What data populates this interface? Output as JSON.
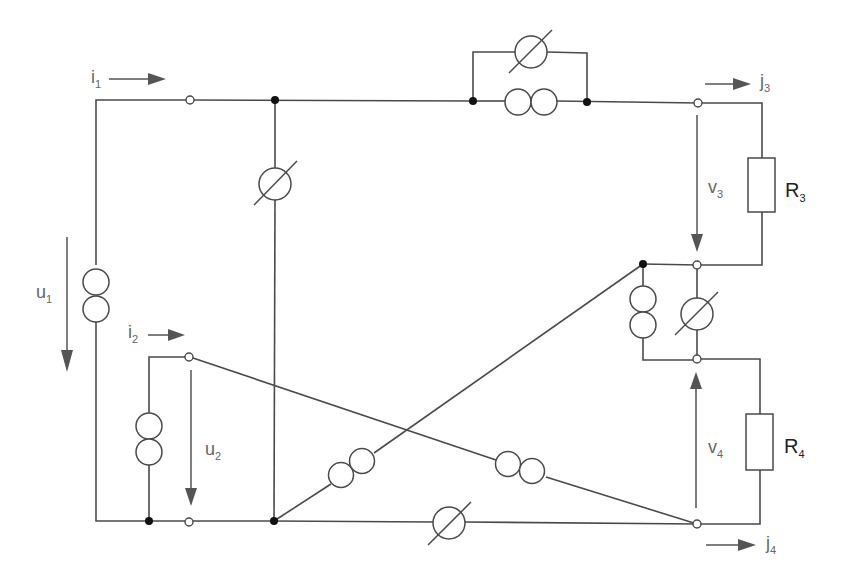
{
  "diagram": {
    "type": "electrical circuit schematic",
    "labels": {
      "i1": {
        "main": "i",
        "sub": "1"
      },
      "i2": {
        "main": "i",
        "sub": "2"
      },
      "j3": {
        "main": "j",
        "sub": "3"
      },
      "j4": {
        "main": "j",
        "sub": "4"
      },
      "u1": {
        "main": "u",
        "sub": "1"
      },
      "u2": {
        "main": "u",
        "sub": "2"
      },
      "v3": {
        "main": "v",
        "sub": "3"
      },
      "v4": {
        "main": "v",
        "sub": "4"
      },
      "R3": {
        "main": "R",
        "sub": "3"
      },
      "R4": {
        "main": "R",
        "sub": "4"
      }
    },
    "components": [
      {
        "id": "transformer-u1",
        "kind": "double-circle (transformer/coupled source)",
        "location": "left vertical branch"
      },
      {
        "id": "transformer-u2",
        "kind": "double-circle",
        "location": "lower-left port branch"
      },
      {
        "id": "meter-vertical-left",
        "kind": "circle with slash (variable source)",
        "location": "center-left vertical branch"
      },
      {
        "id": "meter-top",
        "kind": "circle with slash",
        "location": "top parallel branch"
      },
      {
        "id": "transformer-top",
        "kind": "double-circle",
        "location": "top series"
      },
      {
        "id": "resistor-R3",
        "kind": "resistor",
        "location": "right upper"
      },
      {
        "id": "resistor-R4",
        "kind": "resistor",
        "location": "right lower"
      },
      {
        "id": "transformer-mid",
        "kind": "double-circle",
        "location": "right middle parallel"
      },
      {
        "id": "meter-mid",
        "kind": "circle with slash",
        "location": "right middle parallel"
      },
      {
        "id": "transformer-diag-up",
        "kind": "double-circle",
        "location": "diagonal rising"
      },
      {
        "id": "transformer-diag-down",
        "kind": "double-circle",
        "location": "diagonal falling"
      },
      {
        "id": "meter-bottom",
        "kind": "circle with slash",
        "location": "bottom series"
      }
    ],
    "colors": {
      "wire": "#4a4a4a",
      "label": "#666666",
      "resistor_label": "#222222",
      "node": "#111111"
    }
  }
}
